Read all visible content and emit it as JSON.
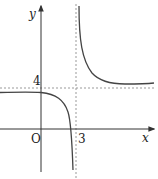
{
  "diagram": {
    "type": "function-graph",
    "axes": {
      "x_label": "x",
      "y_label": "y",
      "origin_label": "O"
    },
    "asymptotes": {
      "vertical": {
        "value": 3,
        "label": "3"
      },
      "horizontal": {
        "value": 4,
        "label": "4"
      }
    },
    "colors": {
      "curve": "#444444",
      "axis": "#333333",
      "asymptote": "#999999"
    }
  }
}
